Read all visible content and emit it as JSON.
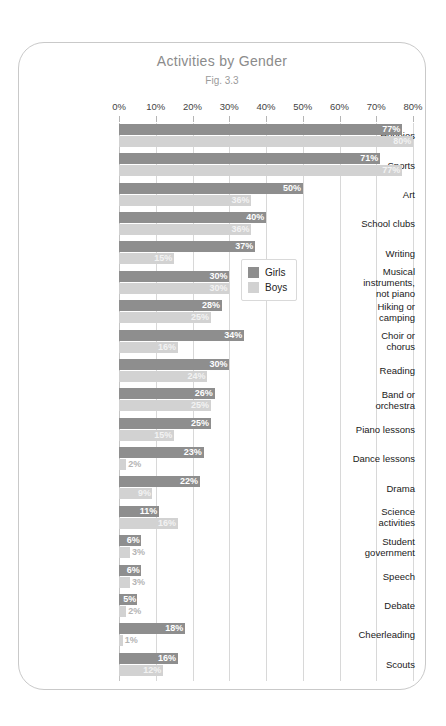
{
  "chart_data": {
    "type": "bar",
    "orientation": "horizontal",
    "title": "Activities by Gender",
    "subtitle": "Fig. 3.3",
    "xlabel": "",
    "ylabel": "",
    "xlim": [
      0,
      80
    ],
    "xticks": [
      "0%",
      "10%",
      "20%",
      "30%",
      "40%",
      "50%",
      "60%",
      "70%",
      "80%"
    ],
    "xtick_values": [
      0,
      10,
      20,
      30,
      40,
      50,
      60,
      70,
      80
    ],
    "grid": true,
    "legend_position": "upper right inside",
    "value_suffix": "%",
    "categories": [
      "Hobbies",
      "Sports",
      "Art",
      "School clubs",
      "Writing",
      "Musical instruments, not piano",
      "Hiking or camping",
      "Choir or chorus",
      "Reading",
      "Band or orchestra",
      "Piano lessons",
      "Dance lessons",
      "Drama",
      "Science activities",
      "Student government",
      "Speech",
      "Debate",
      "Cheerleading",
      "Scouts"
    ],
    "series": [
      {
        "name": "Girls",
        "color": "#8e8e8e",
        "values": [
          77,
          71,
          50,
          40,
          37,
          30,
          28,
          34,
          30,
          26,
          25,
          23,
          22,
          11,
          6,
          6,
          5,
          18,
          16
        ]
      },
      {
        "name": "Boys",
        "color": "#d2d2d2",
        "values": [
          80,
          77,
          36,
          36,
          15,
          30,
          25,
          16,
          24,
          25,
          15,
          2,
          9,
          16,
          3,
          3,
          2,
          1,
          12
        ]
      }
    ]
  },
  "legend": {
    "items": [
      {
        "label": "Girls",
        "swatch": "girls"
      },
      {
        "label": "Boys",
        "swatch": "boys"
      }
    ]
  },
  "colors": {
    "girls": "#8e8e8e",
    "boys": "#d2d2d2",
    "card_border": "#c9c9c9",
    "gridline": "#d8d8d8",
    "title": "#8b8b8b",
    "background": "#ffffff"
  }
}
